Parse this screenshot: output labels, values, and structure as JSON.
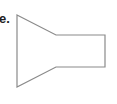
{
  "option": {
    "label": "e."
  },
  "figure": {
    "shape": "funnel-shape",
    "stroke_color": "#8a8a8a",
    "fill_color": "#ffffff",
    "stroke_width": 1.2,
    "points": "17,15 56,35 105,35 105,67 56,67 17,87"
  }
}
